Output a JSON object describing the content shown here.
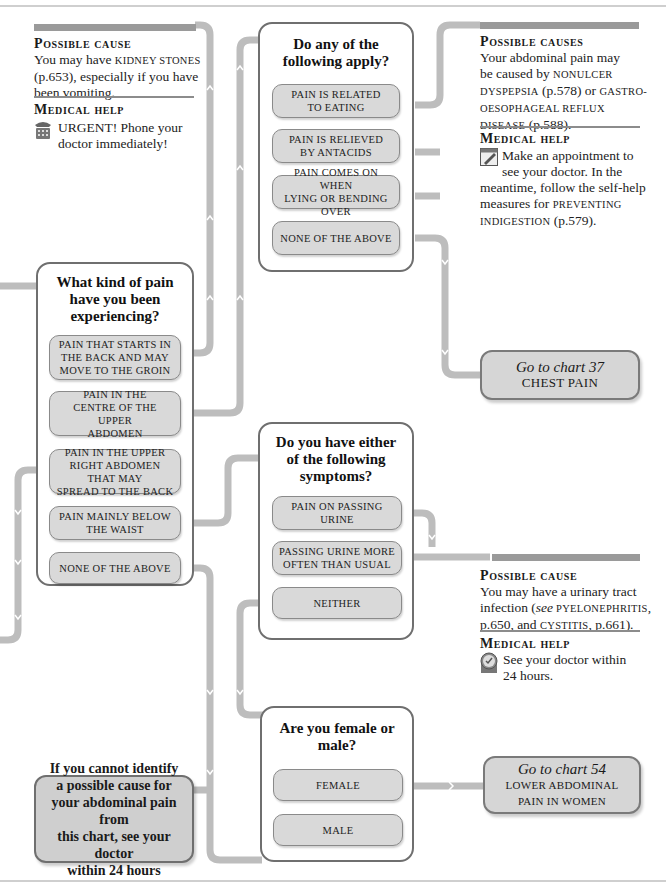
{
  "chart": {
    "colors": {
      "connector": "#bdbdbd",
      "box_border": "#6f6f6f",
      "option_fill": "#d9d9d9",
      "header_bar": "#9a9a9a",
      "goto_fill": "#d6d6d6"
    }
  },
  "panel_kidney": {
    "cause_heading": "Possible cause",
    "cause_pre": "You may have ",
    "cause_link": "Kidney stones",
    "cause_post": " (p.653), especially if you have been vomiting.",
    "help_heading": "Medical help",
    "help_icon": "telephone-icon",
    "help_text_1": "URGENT! Phone your",
    "help_text_2": "doctor immediately!"
  },
  "q_apply": {
    "title_1": "Do any of the",
    "title_2": "following apply?",
    "options": [
      {
        "l1": "Pain is related",
        "l2": "to eating"
      },
      {
        "l1": "Pain is relieved",
        "l2": "by antacids"
      },
      {
        "l1": "Pain comes on when",
        "l2": "lying or bending over"
      },
      {
        "l1": "None of the above",
        "l2": ""
      }
    ]
  },
  "panel_dyspepsia": {
    "cause_heading": "Possible causes",
    "line1": "Your abdominal pain may",
    "line2_pre": "be caused by ",
    "line2_link": "Nonulcer",
    "line3_link": "dyspepsia",
    "line3_mid": " (p.578) or ",
    "line3_link2": "gastro-",
    "line4_link": "oesophageal reflux",
    "line5_link": "disease",
    "line5_post": " (p.588).",
    "help_heading": "Medical help",
    "help_icon": "appointment-calendar-icon",
    "help_1": "Make an appointment to",
    "help_2": "see your doctor. In the",
    "help_3": "meantime, follow the self-help",
    "help_4_pre": "measures for ",
    "help_4_link": "Preventing",
    "help_5_link": "indigestion",
    "help_5_post": " (p.579)."
  },
  "q_kind": {
    "title_1": "What kind of pain",
    "title_2": "have you been",
    "title_3": "experiencing?",
    "options": [
      {
        "l1": "Pain that starts in",
        "l2": "the back and may",
        "l3": "move to the groin"
      },
      {
        "l1": "Pain in the",
        "l2": "centre of the upper",
        "l3": "abdomen"
      },
      {
        "l1": "Pain in the upper",
        "l2": "right abdomen that may",
        "l3": "spread to the back"
      },
      {
        "l1": "Pain mainly below",
        "l2": "the waist",
        "l3": ""
      },
      {
        "l1": "None of the above",
        "l2": "",
        "l3": ""
      }
    ]
  },
  "goto_37": {
    "line1": "Go to chart 37",
    "line2": "Chest Pain"
  },
  "q_symptoms": {
    "title_1": "Do you have either",
    "title_2": "of the following",
    "title_3": "symptoms?",
    "options": [
      {
        "l1": "Pain on passing urine",
        "l2": ""
      },
      {
        "l1": "passing urine more",
        "l2": "often than usual"
      },
      {
        "l1": "Neither",
        "l2": ""
      }
    ]
  },
  "panel_urinary": {
    "cause_heading": "Possible cause",
    "line1": "You may have a urinary tract",
    "line2_pre": "infection (",
    "line2_see": "see",
    "line2_link": " Pyelonephritis",
    "line2_post": ",",
    "line3_pre": "p.650, and ",
    "line3_link": "Cystitis",
    "line3_post": ", p.661).",
    "help_heading": "Medical help",
    "help_icon": "clock-icon",
    "help_1": "See your doctor within",
    "help_2": "24 hours."
  },
  "q_sex": {
    "title_1": "Are you female or",
    "title_2": "male?",
    "options": [
      {
        "l1": "Female"
      },
      {
        "l1": "Male"
      }
    ]
  },
  "goto_54": {
    "line1": "Go to chart 54",
    "line2": "Lower abdominal",
    "line3": "pain in women"
  },
  "advice": {
    "l1": "If you cannot identify",
    "l2": "a possible cause for",
    "l3": "your abdominal pain from",
    "l4": "this chart, see your doctor",
    "l5": "within 24 hours"
  }
}
